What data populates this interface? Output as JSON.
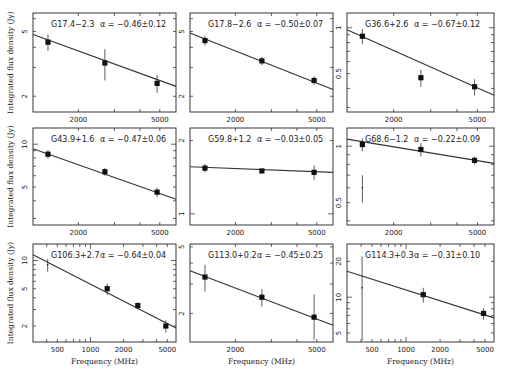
{
  "figure": {
    "x_axis_label": "Frequency (MHz)",
    "y_axis_label": "Integrated flux density (Jy)"
  },
  "chart_data": [
    {
      "type": "scatter",
      "title": "G17.4−2.3",
      "alpha": "α = −0.46±0.12",
      "xlabel": "",
      "ylabel": "Integrated flux density (Jy)",
      "x_scale": "log",
      "y_scale": "log",
      "xlim": [
        1200,
        6000
      ],
      "ylim": [
        1.6,
        6.5
      ],
      "xticks": [
        2000,
        5000
      ],
      "yticks": [
        2,
        5
      ],
      "points": [
        {
          "x": 1420,
          "y": 4.3,
          "err": 0.5
        },
        {
          "x": 2695,
          "y": 3.2,
          "err": 0.7
        },
        {
          "x": 4850,
          "y": 2.4,
          "err": 0.3
        }
      ],
      "fit": {
        "x0": 1200,
        "y0": 4.8,
        "x1": 6000,
        "y1": 2.3
      }
    },
    {
      "type": "scatter",
      "title": "G17.8−2.6",
      "alpha": "α = −0.50±0.07",
      "xlabel": "",
      "ylabel": "",
      "x_scale": "log",
      "y_scale": "log",
      "xlim": [
        1200,
        6000
      ],
      "ylim": [
        1.6,
        6.5
      ],
      "xticks": [
        2000,
        5000
      ],
      "yticks": [
        2,
        5
      ],
      "points": [
        {
          "x": 1420,
          "y": 4.4,
          "err": 0.3
        },
        {
          "x": 2695,
          "y": 3.3,
          "err": 0.2
        },
        {
          "x": 4850,
          "y": 2.5,
          "err": 0.15
        }
      ],
      "fit": {
        "x0": 1200,
        "y0": 4.9,
        "x1": 6000,
        "y1": 2.2
      }
    },
    {
      "type": "scatter",
      "title": "G36.6+2.6",
      "alpha": "α = −0.67±0.12",
      "xlabel": "",
      "ylabel": "",
      "x_scale": "log",
      "y_scale": "log",
      "xlim": [
        1200,
        6000
      ],
      "ylim": [
        0.28,
        1.25
      ],
      "xticks": [
        2000,
        5000
      ],
      "yticks": [
        0.5,
        1
      ],
      "points": [
        {
          "x": 1420,
          "y": 0.88,
          "err": 0.1
        },
        {
          "x": 2695,
          "y": 0.47,
          "err": 0.06
        },
        {
          "x": 4850,
          "y": 0.41,
          "err": 0.05
        }
      ],
      "fit": {
        "x0": 1200,
        "y0": 0.97,
        "x1": 6000,
        "y1": 0.36
      }
    },
    {
      "type": "scatter",
      "title": "G43.9+1.6",
      "alpha": "α = −0.47±0.06",
      "xlabel": "",
      "ylabel": "Integrated flux density (Jy)",
      "x_scale": "log",
      "y_scale": "log",
      "xlim": [
        1200,
        6000
      ],
      "ylim": [
        2.7,
        13
      ],
      "xticks": [
        2000,
        5000
      ],
      "yticks": [
        5,
        10
      ],
      "points": [
        {
          "x": 1420,
          "y": 8.5,
          "err": 0.6
        },
        {
          "x": 2695,
          "y": 6.4,
          "err": 0.4
        },
        {
          "x": 4850,
          "y": 4.6,
          "err": 0.35
        }
      ],
      "fit": {
        "x0": 1200,
        "y0": 9.3,
        "x1": 6000,
        "y1": 4.1
      }
    },
    {
      "type": "scatter",
      "title": "G59.8+1.2",
      "alpha": "α = −0.03±0.05",
      "xlabel": "",
      "ylabel": "",
      "x_scale": "log",
      "y_scale": "log",
      "xlim": [
        1200,
        6000
      ],
      "ylim": [
        0.9,
        2.25
      ],
      "xticks": [
        2000,
        5000
      ],
      "yticks": [
        1,
        2
      ],
      "points": [
        {
          "x": 1420,
          "y": 1.54,
          "err": 0.06
        },
        {
          "x": 2695,
          "y": 1.5,
          "err": 0.03
        },
        {
          "x": 4850,
          "y": 1.48,
          "err": 0.1
        }
      ],
      "fit": {
        "x0": 1200,
        "y0": 1.56,
        "x1": 6000,
        "y1": 1.48
      }
    },
    {
      "type": "scatter",
      "title": "G68.6−1.2",
      "alpha": "α = −0.22±0.09",
      "xlabel": "",
      "ylabel": "",
      "x_scale": "log",
      "y_scale": "log",
      "xlim": [
        1200,
        6000
      ],
      "ylim": [
        0.38,
        1.25
      ],
      "xticks": [
        2000,
        5000
      ],
      "yticks": [
        0.5,
        1
      ],
      "points": [
        {
          "x": 1420,
          "y": 1.02,
          "err": 0.08
        },
        {
          "x": 2695,
          "y": 0.96,
          "err": 0.08
        },
        {
          "x": 4850,
          "y": 0.84,
          "err": 0.04
        },
        {
          "x": 1420,
          "y": 0.6,
          "err": 0.1,
          "open": true
        }
      ],
      "fit": {
        "x0": 1200,
        "y0": 1.09,
        "x1": 6000,
        "y1": 0.81
      }
    },
    {
      "type": "scatter",
      "title": "G106.3+2.7",
      "alpha": "α = −0.64±0.04",
      "xlabel": "Frequency (MHz)",
      "ylabel": "Integrated flux density (Jy)",
      "x_scale": "log",
      "y_scale": "log",
      "xlim": [
        300,
        6000
      ],
      "ylim": [
        1.35,
        15
      ],
      "xticks": [
        500,
        1000,
        2000,
        5000
      ],
      "yticks": [
        2,
        5,
        10
      ],
      "points": [
        {
          "x": 408,
          "y": 9.0,
          "err": 1.4,
          "open": true
        },
        {
          "x": 1420,
          "y": 5.0,
          "err": 0.7
        },
        {
          "x": 2695,
          "y": 3.3,
          "err": 0.3
        },
        {
          "x": 4850,
          "y": 2.0,
          "err": 0.3
        }
      ],
      "fit": {
        "x0": 300,
        "y0": 11.5,
        "x1": 6000,
        "y1": 1.9
      }
    },
    {
      "type": "scatter",
      "title": "G113.0+0.2",
      "alpha": "α = −0.45±0.25",
      "xlabel": "Frequency (MHz)",
      "ylabel": "",
      "x_scale": "log",
      "y_scale": "log",
      "xlim": [
        1200,
        6000
      ],
      "ylim": [
        1.35,
        5.2
      ],
      "xticks": [
        2000,
        5000
      ],
      "yticks": [
        2,
        5
      ],
      "points": [
        {
          "x": 1420,
          "y": 3.3,
          "err": 0.6
        },
        {
          "x": 2695,
          "y": 2.5,
          "err": 0.3
        },
        {
          "x": 4850,
          "y": 1.9,
          "err": 0.7
        }
      ],
      "fit": {
        "x0": 1200,
        "y0": 3.6,
        "x1": 6000,
        "y1": 1.7
      }
    },
    {
      "type": "scatter",
      "title": "G114.3+0.3",
      "alpha": "α = −0.31±0.10",
      "xlabel": "Frequency (MHz)",
      "ylabel": "",
      "x_scale": "log",
      "y_scale": "log",
      "xlim": [
        300,
        6000
      ],
      "ylim": [
        4.2,
        28
      ],
      "xticks": [
        500,
        1000,
        2000,
        5000
      ],
      "yticks": [
        5,
        10,
        20
      ],
      "points": [
        {
          "x": 408,
          "y": 12,
          "err": 10,
          "open": true
        },
        {
          "x": 1420,
          "y": 10.5,
          "err": 1.5
        },
        {
          "x": 4850,
          "y": 7.3,
          "err": 0.8
        }
      ],
      "fit": {
        "x0": 300,
        "y0": 16.5,
        "x1": 6000,
        "y1": 6.7
      }
    }
  ]
}
